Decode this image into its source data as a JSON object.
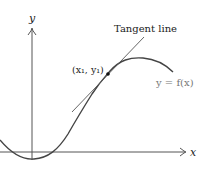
{
  "figure": {
    "axes": {
      "x_label": "x",
      "y_label": "y"
    },
    "labels": {
      "tangent": "Tangent line",
      "point": "(x₁, y₁)",
      "curve": "y = f(x)"
    },
    "colors": {
      "axis": "#555555",
      "curve": "#444444",
      "tangent": "#555555",
      "point": "#111111",
      "curve_label": "#777777"
    }
  }
}
